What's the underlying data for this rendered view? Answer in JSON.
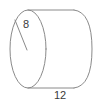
{
  "diagram": {
    "type": "cylinder",
    "shape_name": "cylinder",
    "stroke_color": "#8a8a8a",
    "label_color": "#3a3a3a",
    "background_color": "#ffffff",
    "labels": {
      "radius": "8",
      "length": "12"
    },
    "annotations": [
      {
        "name": "radius-label",
        "text": "8",
        "measures": "radius-of-circular-face",
        "x": 26,
        "y": 28
      },
      {
        "name": "length-label",
        "text": "12",
        "measures": "length-of-cylinder",
        "x": 60,
        "y": 99
      }
    ],
    "geometry": {
      "left_ellipse_center_x": 28,
      "left_ellipse_center_y": 49,
      "left_ellipse_rx": 18,
      "left_ellipse_ry": 39,
      "right_end_x": 92,
      "top_edge_y": 10,
      "bottom_edge_y": 88,
      "radius_line_from": [
        15,
        20
      ],
      "radius_line_to": [
        27,
        50
      ]
    }
  }
}
